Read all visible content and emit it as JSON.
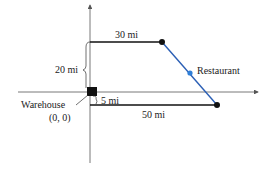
{
  "diagram": {
    "labels": {
      "top_segment": "30 mi",
      "vertical": "20 mi",
      "restaurant": "Restaurant",
      "warehouse": "Warehouse",
      "origin": "(0, 0)",
      "offset": "5 mi",
      "bottom_segment": "50 mi"
    },
    "colors": {
      "line": "#111111",
      "route": "#2b5fb5",
      "restaurant_dot": "#2f7fd8",
      "axis": "#555555"
    },
    "points": {
      "warehouse": [
        0,
        0
      ],
      "top_end": [
        30,
        20
      ],
      "bottom_end": [
        50,
        -5
      ],
      "restaurant": "midpoint of top_end and bottom_end"
    }
  }
}
